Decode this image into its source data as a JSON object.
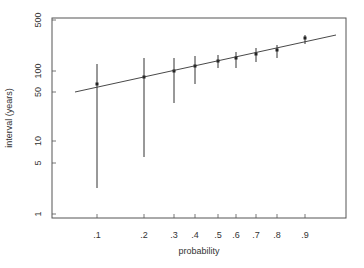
{
  "chart_data": {
    "type": "scatter",
    "title": "",
    "xlabel": "probability",
    "ylabel": "interval (years)",
    "yscale": "log",
    "ylim": [
      1,
      500
    ],
    "y_ticks": [
      1,
      5,
      10,
      50,
      100,
      500
    ],
    "y_tick_labels": [
      "1",
      "5",
      "10",
      "50",
      "100",
      "500"
    ],
    "x_ticks": [
      0.1,
      0.2,
      0.3,
      0.4,
      0.5,
      0.6,
      0.7,
      0.8,
      0.9
    ],
    "x_tick_labels": [
      ".1",
      ".2",
      ".3",
      ".4",
      ".5",
      ".6",
      ".7",
      ".8",
      ".9"
    ],
    "grid": false,
    "legend": null,
    "series": [
      {
        "name": "estimates with intervals",
        "x": [
          0.1,
          0.2,
          0.3,
          0.4,
          0.5,
          0.6,
          0.7,
          0.8,
          0.9
        ],
        "y": [
          62,
          78,
          95,
          118,
          140,
          160,
          185,
          215,
          280
        ],
        "lower": [
          5.5,
          14,
          33,
          62,
          105,
          105,
          130,
          155,
          245
        ],
        "upper": [
          130,
          150,
          150,
          165,
          180,
          195,
          225,
          250,
          330
        ]
      },
      {
        "name": "fitted line",
        "type": "line",
        "x": [
          0.06,
          1.0
        ],
        "y": [
          50,
          320
        ]
      }
    ]
  },
  "layout": {
    "plot_box": {
      "left": 52,
      "top": 18,
      "right": 346,
      "bottom": 218
    },
    "y_pixels": {
      "1": 214,
      "5": 163,
      "10": 141,
      "50": 92,
      "100": 71,
      "500": 20
    },
    "x_pixels": [
      97,
      144,
      174,
      195,
      218,
      236,
      256,
      277,
      305
    ],
    "bars": [
      {
        "top": 64,
        "bottom": 188,
        "point": 84
      },
      {
        "top": 58,
        "bottom": 157,
        "point": 77
      },
      {
        "top": 58,
        "bottom": 103,
        "point": 71
      },
      {
        "top": 56,
        "bottom": 84,
        "point": 66
      },
      {
        "top": 55,
        "bottom": 68,
        "point": 61
      },
      {
        "top": 52,
        "bottom": 68,
        "point": 58
      },
      {
        "top": 48,
        "bottom": 62,
        "point": 54
      },
      {
        "top": 45,
        "bottom": 58,
        "point": 50
      },
      {
        "top": 35,
        "bottom": 44,
        "point": 38
      }
    ],
    "fit_line": {
      "x1": 75,
      "y1": 92,
      "x2": 336,
      "y2": 35
    },
    "colors": {
      "axis": "#555555",
      "line": "#333333",
      "text": "#333333"
    }
  }
}
